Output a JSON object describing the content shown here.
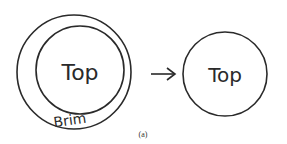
{
  "diagram": {
    "left": {
      "outer_label": "Brim",
      "inner_label": "Top"
    },
    "right": {
      "label": "Top"
    },
    "arrow": "→",
    "caption": "(a)",
    "stroke_color": "#2a2a2a"
  }
}
